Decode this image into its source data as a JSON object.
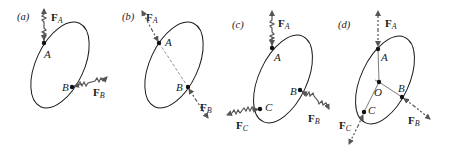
{
  "figure": {
    "panels": [
      {
        "id": "a",
        "label": "(a)",
        "points": [
          {
            "name": "A"
          },
          {
            "name": "B"
          }
        ],
        "forces": [
          {
            "symbol": "F",
            "subscript": "A",
            "style": "wavy"
          },
          {
            "symbol": "F",
            "subscript": "B",
            "style": "wavy"
          }
        ]
      },
      {
        "id": "b",
        "label": "(b)",
        "points": [
          {
            "name": "A"
          },
          {
            "name": "B"
          }
        ],
        "forces": [
          {
            "symbol": "F",
            "subscript": "A",
            "style": "dashed"
          },
          {
            "symbol": "F",
            "subscript": "B",
            "style": "dashed"
          }
        ]
      },
      {
        "id": "c",
        "label": "(c)",
        "points": [
          {
            "name": "A"
          },
          {
            "name": "B"
          },
          {
            "name": "C"
          }
        ],
        "forces": [
          {
            "symbol": "F",
            "subscript": "A",
            "style": "wavy"
          },
          {
            "symbol": "F",
            "subscript": "B",
            "style": "wavy"
          },
          {
            "symbol": "F",
            "subscript": "C",
            "style": "wavy"
          }
        ]
      },
      {
        "id": "d",
        "label": "(d)",
        "points": [
          {
            "name": "A"
          },
          {
            "name": "O"
          },
          {
            "name": "B"
          },
          {
            "name": "C"
          }
        ],
        "forces": [
          {
            "symbol": "F",
            "subscript": "A",
            "style": "dashed"
          },
          {
            "symbol": "F",
            "subscript": "B",
            "style": "dashed"
          },
          {
            "symbol": "F",
            "subscript": "C",
            "style": "dashed"
          }
        ]
      }
    ]
  }
}
